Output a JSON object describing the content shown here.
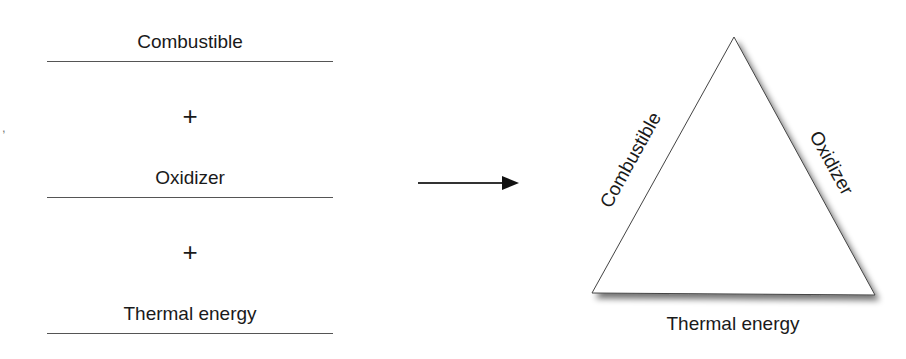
{
  "left_equation": {
    "terms": [
      {
        "label": "Combustible"
      },
      {
        "label": "Oxidizer"
      },
      {
        "label": "Thermal energy"
      }
    ],
    "operators": [
      "+",
      "+"
    ]
  },
  "arrow": {
    "direction": "right"
  },
  "triangle": {
    "left_side": "Combustible",
    "right_side": "Oxidizer",
    "bottom_side": "Thermal energy"
  },
  "margin_mark": ","
}
